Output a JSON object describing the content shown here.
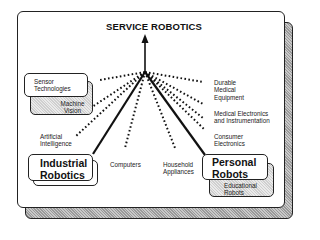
{
  "diagram": {
    "title": "SERVICE ROBOTICS",
    "left_cluster": {
      "front_box": "Sensor Technologies",
      "back_box": "Machine Vision"
    },
    "main_nodes": {
      "industrial": "Industrial Robotics",
      "personal": "Personal Robots"
    },
    "sub_nodes": {
      "educational": "Educational Robots"
    },
    "labels": {
      "artificial_intelligence": "Artificial Intelligence",
      "computers": "Computers",
      "household_appliances": "Household Appliances",
      "durable_medical": "Durable Medical Equipment",
      "medical_electronics": "Medical Electronics and Instrumentation",
      "consumer_electronics": "Consumer Electronics"
    },
    "edges": [
      {
        "from": "Industrial Robotics",
        "to": "SERVICE ROBOTICS",
        "style": "solid"
      },
      {
        "from": "Personal Robots",
        "to": "SERVICE ROBOTICS",
        "style": "solid"
      },
      {
        "from": "Sensor Technologies",
        "to": "SERVICE ROBOTICS",
        "style": "dotted"
      },
      {
        "from": "Machine Vision",
        "to": "SERVICE ROBOTICS",
        "style": "dotted"
      },
      {
        "from": "Artificial Intelligence",
        "to": "SERVICE ROBOTICS",
        "style": "dotted"
      },
      {
        "from": "Computers",
        "to": "SERVICE ROBOTICS",
        "style": "dotted"
      },
      {
        "from": "Household Appliances",
        "to": "SERVICE ROBOTICS",
        "style": "dotted"
      },
      {
        "from": "Durable Medical Equipment",
        "to": "SERVICE ROBOTICS",
        "style": "dotted"
      },
      {
        "from": "Medical Electronics and Instrumentation",
        "to": "SERVICE ROBOTICS",
        "style": "dotted"
      },
      {
        "from": "Consumer Electronics",
        "to": "SERVICE ROBOTICS",
        "style": "dotted"
      }
    ]
  }
}
